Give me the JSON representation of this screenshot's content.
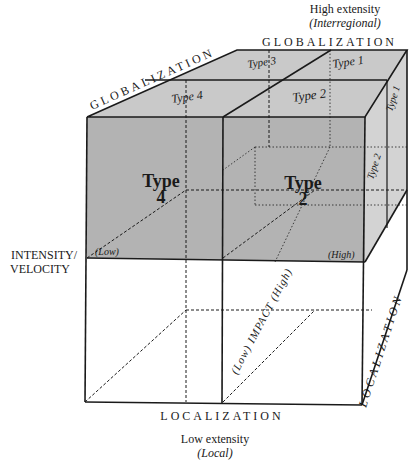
{
  "axes": {
    "high_extensity": "High extensity",
    "high_extensity_sub": "(Interregional)",
    "low_extensity": "Low extensity",
    "low_extensity_sub": "(Local)",
    "globalization_top": "GLOBALIZATION",
    "globalization_diag": "GLOBALIZATION",
    "localization_bottom": "LOCALIZATION",
    "localization_right": "LOCALIZATION",
    "intensity_line1": "INTENSITY/",
    "intensity_line2": "VELOCITY",
    "intensity_low": "(Low)",
    "intensity_high": "(High)",
    "impact_label": "(Low) IMPACT (High)"
  },
  "cells": {
    "top_type3": "Type 3",
    "top_type1": "Type 1",
    "top_type4": "Type 4",
    "top_type2": "Type 2",
    "side_type1": "Type 1",
    "side_type2": "Type 2",
    "front_type4_word": "Type",
    "front_type4_num": "4",
    "front_type2_word": "Type",
    "front_type2_num": "2"
  },
  "colors": {
    "shaded": "#b4b4b4",
    "top_shade": "#c8c8c8",
    "side_shade": "#d2d2d2",
    "line": "#1a1a1a"
  }
}
